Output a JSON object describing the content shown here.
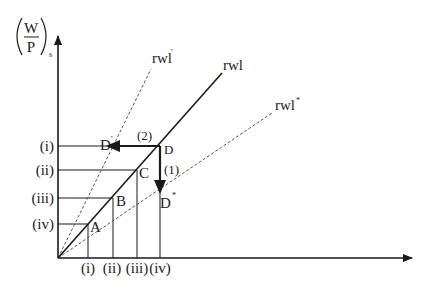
{
  "diagram": {
    "y_axis_label": {
      "numerator": "W",
      "denominator": "P",
      "subscript": "s"
    },
    "curves": {
      "rwl": "rwl",
      "rwl_prime": "rwl",
      "rwl_prime_mark": "'",
      "rwl_star": "rwl",
      "rwl_star_mark": "*"
    },
    "y_ticks": [
      "(i)",
      "(ii)",
      "(iii)",
      "(iv)"
    ],
    "x_ticks": [
      "(i)",
      "(ii)",
      "(iii)",
      "(iv)"
    ],
    "points": {
      "A": "A",
      "B": "B",
      "C": "C",
      "D": "D",
      "D_prime": "D",
      "D_prime_mark": "'",
      "D_star": "D",
      "D_star_mark": "*"
    },
    "arrows": {
      "arrow_1": "(1)",
      "arrow_2": "(2)"
    },
    "colors": {
      "ink": "#1a1a1a",
      "dashed": "#555555"
    }
  }
}
